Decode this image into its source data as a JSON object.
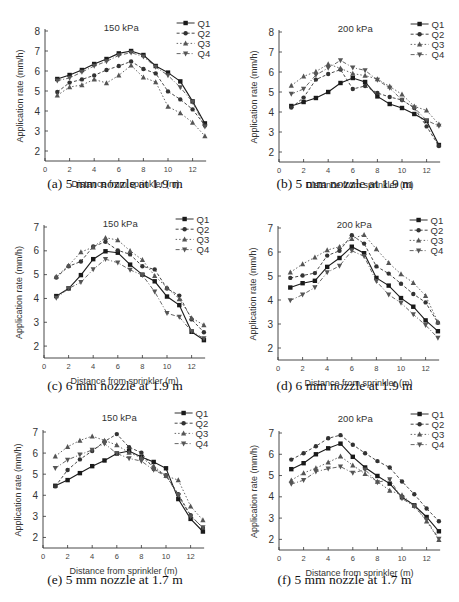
{
  "figure": {
    "captions": [
      "(a) 5 mm nozzle at 1.9 m",
      "(b) 5 mm nozzle at 1.9 m",
      "(c) 6 mm nozzle at 1.9 m",
      "(d) 6 mm nozzle at 1.9 m",
      "(e) 5 mm nozzle at 1.7 m",
      "(f) 5 mm nozzle at 1.7 m"
    ]
  },
  "chart_data": [
    {
      "id": "a",
      "type": "line",
      "title": "150 kPa",
      "caption": "(a) 5 mm nozzle at 1.9 m",
      "xlabel": "Distance from sprinkler (m)",
      "ylabel": "Application rate (mm/h)",
      "xlim": [
        0,
        13
      ],
      "ylim": [
        1.5,
        8
      ],
      "xticks": [
        0,
        2,
        4,
        6,
        8,
        10,
        12
      ],
      "yticks": [
        2,
        3,
        4,
        5,
        6,
        7,
        8
      ],
      "legend_position": "top-right",
      "grid": false,
      "x": [
        1,
        2,
        3,
        4,
        5,
        6,
        7,
        8,
        9,
        10,
        11,
        12,
        13
      ],
      "series": [
        {
          "name": "Q1",
          "values": [
            5.6,
            5.8,
            6.05,
            6.35,
            6.6,
            6.88,
            7.0,
            6.8,
            6.25,
            5.92,
            5.48,
            4.48,
            3.38
          ]
        },
        {
          "name": "Q2",
          "values": [
            4.95,
            5.42,
            5.58,
            5.78,
            6.05,
            6.25,
            6.48,
            6.1,
            5.88,
            4.98,
            4.58,
            4.08,
            3.28
          ]
        },
        {
          "name": "Q3",
          "values": [
            4.78,
            5.2,
            5.3,
            5.58,
            5.4,
            5.78,
            6.28,
            5.68,
            5.45,
            4.22,
            3.9,
            3.42,
            2.75
          ]
        },
        {
          "name": "Q4",
          "values": [
            5.52,
            5.65,
            5.95,
            6.25,
            6.48,
            6.78,
            6.92,
            6.72,
            6.2,
            5.78,
            5.18,
            4.45,
            3.22
          ]
        }
      ]
    },
    {
      "id": "b",
      "type": "line",
      "title": "200 kPa",
      "caption": "(b) 5 mm nozzle at 1.9 m",
      "xlabel": "Distance from sprinkler (m)",
      "ylabel": "Application rate (mm/h)",
      "xlim": [
        0,
        13
      ],
      "ylim": [
        1.5,
        8
      ],
      "xticks": [
        0,
        2,
        4,
        6,
        8,
        10,
        12
      ],
      "yticks": [
        2,
        3,
        4,
        5,
        6,
        7,
        8
      ],
      "legend_position": "top-right",
      "grid": false,
      "x": [
        1,
        2,
        3,
        4,
        5,
        6,
        7,
        8,
        9,
        10,
        11,
        12,
        13
      ],
      "series": [
        {
          "name": "Q1",
          "values": [
            4.3,
            4.5,
            4.7,
            5.0,
            5.45,
            5.7,
            5.5,
            4.78,
            4.4,
            4.2,
            3.9,
            3.55,
            2.35
          ]
        },
        {
          "name": "Q2",
          "values": [
            4.22,
            4.72,
            5.62,
            5.9,
            6.12,
            5.15,
            5.3,
            4.95,
            4.75,
            4.6,
            4.2,
            3.28,
            2.3
          ]
        },
        {
          "name": "Q3",
          "values": [
            5.32,
            5.78,
            6.02,
            6.4,
            6.18,
            5.92,
            5.82,
            5.65,
            5.28,
            4.88,
            4.28,
            4.08,
            3.38
          ]
        },
        {
          "name": "Q4",
          "values": [
            4.9,
            5.15,
            5.85,
            6.2,
            6.58,
            6.22,
            6.08,
            5.6,
            5.2,
            4.6,
            4.22,
            3.58,
            3.3
          ]
        }
      ]
    },
    {
      "id": "c",
      "type": "line",
      "title": "150 kPa",
      "caption": "(c) 6 mm nozzle at 1.9 m",
      "xlabel": "Distance from sprinkler (m)",
      "ylabel": "Application rate (mm/h)",
      "xlim": [
        0,
        13
      ],
      "ylim": [
        1.5,
        7
      ],
      "xticks": [
        0,
        2,
        4,
        6,
        8,
        10,
        12
      ],
      "yticks": [
        2,
        3,
        4,
        5,
        6,
        7
      ],
      "legend_position": "top-right",
      "grid": false,
      "x": [
        1,
        2,
        3,
        4,
        5,
        6,
        7,
        8,
        9,
        10,
        11,
        12,
        13
      ],
      "series": [
        {
          "name": "Q1",
          "values": [
            4.1,
            4.42,
            4.98,
            5.65,
            5.98,
            5.92,
            5.42,
            5.0,
            4.72,
            4.08,
            3.72,
            2.6,
            2.25
          ]
        },
        {
          "name": "Q2",
          "values": [
            4.88,
            5.35,
            5.55,
            6.18,
            6.38,
            6.02,
            5.85,
            5.35,
            5.22,
            4.42,
            4.12,
            3.12,
            2.58
          ]
        },
        {
          "name": "Q3",
          "values": [
            4.92,
            5.38,
            5.95,
            6.15,
            6.55,
            6.45,
            6.0,
            5.62,
            4.95,
            4.45,
            3.98,
            3.18,
            2.88
          ]
        },
        {
          "name": "Q4",
          "values": [
            4.02,
            4.42,
            4.68,
            5.22,
            5.65,
            5.5,
            5.2,
            4.98,
            4.28,
            3.38,
            3.22,
            2.62,
            2.32
          ]
        }
      ]
    },
    {
      "id": "d",
      "type": "line",
      "title": "200 kPa",
      "caption": "(d) 6 mm nozzle at 1.9 m",
      "xlabel": "Distance from sprinkler (m)",
      "ylabel": "Application rate (mm/h)",
      "xlim": [
        0,
        13
      ],
      "ylim": [
        1.5,
        7
      ],
      "xticks": [
        0,
        2,
        4,
        6,
        8,
        10,
        12
      ],
      "yticks": [
        2,
        3,
        4,
        5,
        6,
        7
      ],
      "legend_position": "top-right",
      "grid": false,
      "x": [
        1,
        2,
        3,
        4,
        5,
        6,
        7,
        8,
        9,
        10,
        11,
        12,
        13
      ],
      "series": [
        {
          "name": "Q1",
          "values": [
            4.52,
            4.7,
            4.8,
            5.38,
            5.75,
            6.22,
            5.95,
            4.92,
            4.6,
            4.08,
            3.72,
            3.15,
            2.7
          ]
        },
        {
          "name": "Q2",
          "values": [
            4.92,
            5.02,
            5.12,
            5.85,
            6.05,
            6.7,
            6.35,
            5.4,
            5.1,
            4.68,
            4.25,
            3.9,
            3.05
          ]
        },
        {
          "name": "Q3",
          "values": [
            5.15,
            5.5,
            5.78,
            6.08,
            6.22,
            6.55,
            6.72,
            6.12,
            5.55,
            5.08,
            4.72,
            4.18,
            3.08
          ]
        },
        {
          "name": "Q4",
          "values": [
            3.98,
            4.22,
            4.52,
            5.15,
            5.42,
            6.05,
            5.82,
            4.78,
            4.22,
            3.88,
            3.4,
            2.95,
            2.42
          ]
        }
      ]
    },
    {
      "id": "e",
      "type": "line",
      "title": "150 kPa",
      "caption": "(e) 5 mm nozzle at 1.7 m",
      "xlabel": "Distance from sprinkler (m)",
      "ylabel": "Application rate (mm/h)",
      "xlim": [
        0,
        13
      ],
      "ylim": [
        1.5,
        7.5
      ],
      "xticks": [
        0,
        2,
        4,
        6,
        8,
        10,
        12
      ],
      "yticks": [
        2,
        3,
        4,
        5,
        6,
        7
      ],
      "legend_position": "top-right",
      "grid": false,
      "x": [
        1,
        2,
        3,
        4,
        5,
        6,
        7,
        8,
        9,
        10,
        11,
        12,
        13
      ],
      "series": [
        {
          "name": "Q1",
          "values": [
            4.45,
            4.72,
            5.05,
            5.38,
            5.65,
            5.98,
            6.1,
            5.82,
            5.58,
            5.28,
            3.82,
            2.88,
            2.28
          ]
        },
        {
          "name": "Q2",
          "values": [
            4.42,
            5.2,
            5.7,
            6.1,
            6.55,
            6.9,
            6.28,
            6.02,
            5.25,
            4.95,
            4.05,
            3.05,
            2.45
          ]
        },
        {
          "name": "Q3",
          "values": [
            5.85,
            6.3,
            6.6,
            6.8,
            6.6,
            6.38,
            6.02,
            5.78,
            5.38,
            4.92,
            4.72,
            3.48,
            2.82
          ]
        },
        {
          "name": "Q4",
          "values": [
            5.28,
            5.68,
            5.92,
            6.15,
            6.45,
            5.98,
            5.75,
            5.62,
            5.2,
            4.92,
            4.0,
            3.0,
            2.48
          ]
        }
      ]
    },
    {
      "id": "f",
      "type": "line",
      "title": "200 kPa",
      "caption": "(f) 5 mm nozzle at 1.7 m",
      "xlabel": "Distance from sprinkler (m)",
      "ylabel": "Application rate (mm/h)",
      "xlim": [
        0,
        13
      ],
      "ylim": [
        1.5,
        7.5
      ],
      "xticks": [
        0,
        2,
        4,
        6,
        8,
        10,
        12
      ],
      "yticks": [
        2,
        3,
        4,
        5,
        6,
        7
      ],
      "legend_position": "top-right",
      "grid": false,
      "x": [
        1,
        2,
        3,
        4,
        5,
        6,
        7,
        8,
        9,
        10,
        11,
        12,
        13
      ],
      "series": [
        {
          "name": "Q1",
          "values": [
            5.3,
            5.58,
            6.0,
            6.28,
            6.5,
            5.88,
            5.38,
            4.98,
            4.62,
            3.98,
            3.6,
            3.05,
            2.38
          ]
        },
        {
          "name": "Q2",
          "values": [
            5.75,
            6.05,
            6.38,
            6.75,
            6.9,
            6.45,
            6.05,
            5.68,
            5.38,
            4.72,
            4.12,
            3.45,
            2.85
          ]
        },
        {
          "name": "Q3",
          "values": [
            4.78,
            5.12,
            5.35,
            5.62,
            5.9,
            5.48,
            5.08,
            4.72,
            4.3,
            4.08,
            3.58,
            2.85,
            1.98
          ]
        },
        {
          "name": "Q4",
          "values": [
            4.6,
            4.78,
            5.18,
            5.32,
            5.42,
            5.12,
            5.28,
            4.68,
            4.82,
            3.92,
            3.55,
            2.92,
            2.02
          ]
        }
      ]
    }
  ],
  "series_styles": {
    "Q1": {
      "marker": "square",
      "dash": "",
      "color": "#1a1a1a"
    },
    "Q2": {
      "marker": "circle",
      "dash": "3,2",
      "color": "#333333"
    },
    "Q3": {
      "marker": "triangle-up",
      "dash": "1.5,2",
      "color": "#555555"
    },
    "Q4": {
      "marker": "triangle-down",
      "dash": "4,2,1,2",
      "color": "#555555"
    }
  }
}
